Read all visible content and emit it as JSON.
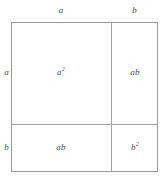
{
  "figure": {
    "line_color": "#9a9a9a",
    "text_color": "#4a4a4a",
    "background_color": "#ffffff"
  },
  "edge_labels": {
    "top_left": "a",
    "top_right": "b",
    "left_upper": "a",
    "left_lower": "b"
  },
  "cells": {
    "top_left": {
      "base": "a",
      "exponent": "2"
    },
    "top_right": {
      "base": "ab",
      "exponent": ""
    },
    "bottom_left": {
      "base": "ab",
      "exponent": ""
    },
    "bottom_right": {
      "base": "b",
      "exponent": "2"
    }
  },
  "chart_data": {
    "type": "table",
    "categories": [
      "a",
      "b"
    ],
    "rows": [
      {
        "row_label": "a",
        "cells": [
          "a²",
          "ab"
        ]
      },
      {
        "row_label": "b",
        "cells": [
          "ab",
          "b²"
        ]
      }
    ],
    "column_labels": [
      "a",
      "b"
    ],
    "row_labels": [
      "a",
      "b"
    ],
    "grid": true,
    "legend": "none"
  }
}
